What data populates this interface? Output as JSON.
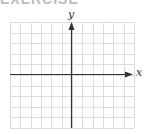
{
  "header": {
    "cut_text": "EXERCISE"
  },
  "diagram": {
    "type": "coordinate-grid",
    "x_axis_label": "x",
    "y_axis_label": "y",
    "grid_columns": 12,
    "grid_rows": 10,
    "colors": {
      "grid": "#dcdcdc",
      "axis": "#333333"
    }
  }
}
